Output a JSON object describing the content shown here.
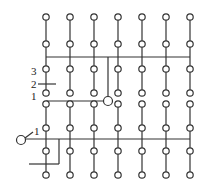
{
  "diagram": {
    "columns_x": [
      46,
      70,
      94,
      118,
      142,
      166,
      190
    ],
    "upper_block_rows_y": [
      17,
      44,
      69,
      93
    ],
    "lower_block_rows_y": [
      104,
      128,
      151,
      175
    ],
    "node_radius": 3.2,
    "line_color": "#333333",
    "upper_bus": {
      "y": 57,
      "x1": 46,
      "x2": 190
    },
    "upper_drop": {
      "x": 108,
      "y1": 57,
      "y2": 97
    },
    "upper_terminal": {
      "cx": 108,
      "cy": 101,
      "r": 4.5
    },
    "upper_feed": {
      "y": 101,
      "x1": 46,
      "x2": 104
    },
    "lower_bus": {
      "y": 139,
      "x1": 25,
      "x2": 190
    },
    "lower_terminal": {
      "cx": 21,
      "cy": 140,
      "r": 4.5
    },
    "lower_branch": {
      "x": 59,
      "y1": 139,
      "y2": 164,
      "x_end": 29
    },
    "marker_line_2": {
      "y": 84,
      "x1": 38,
      "x2": 56
    }
  },
  "labels": {
    "upper_label_3": "3",
    "upper_label_2": "2",
    "upper_label_1": "1",
    "lower_label_1": "1"
  }
}
